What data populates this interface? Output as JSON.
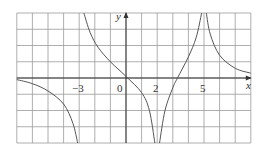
{
  "chart_data": {
    "type": "line",
    "title": "",
    "xlabel": "x",
    "ylabel": "y",
    "xlim": [
      -7,
      8
    ],
    "ylim": [
      -4,
      4
    ],
    "grid": true,
    "grid_step": 1,
    "x_tick_labels": [
      "-3",
      "0",
      "2",
      "5"
    ],
    "x_tick_values": [
      -3,
      0,
      2,
      5
    ],
    "vertical_asymptotes": [
      -3,
      2,
      5
    ],
    "horizontal_asymptote": 0,
    "series": [
      {
        "name": "branch-1",
        "domain": [
          -7,
          -3
        ],
        "behavior": "approaches 0 from below as x→-∞, → -∞ as x→-3⁻",
        "points": [
          [
            -7,
            -0.1
          ],
          [
            -6,
            -0.35
          ],
          [
            -5,
            -0.8
          ],
          [
            -4,
            -1.6
          ],
          [
            -3.4,
            -2.8
          ],
          [
            -3.1,
            -4
          ]
        ]
      },
      {
        "name": "branch-2",
        "domain": [
          -3,
          2
        ],
        "behavior": "+∞ as x→-3⁺, passes through origin, → -∞ as x→2⁻",
        "points": [
          [
            -2.7,
            4
          ],
          [
            -2.3,
            2.8
          ],
          [
            -1.8,
            1.9
          ],
          [
            -1,
            1.0
          ],
          [
            0,
            0.1
          ],
          [
            1,
            -0.9
          ],
          [
            1.5,
            -2
          ],
          [
            1.85,
            -4
          ]
        ]
      },
      {
        "name": "branch-3",
        "domain": [
          2,
          5
        ],
        "behavior": "-∞ as x→2⁺, crosses x-axis near x≈3.3, → +∞ as x→5⁻",
        "points": [
          [
            2.15,
            -4
          ],
          [
            2.5,
            -2
          ],
          [
            3,
            -0.6
          ],
          [
            3.3,
            0
          ],
          [
            4,
            1.3
          ],
          [
            4.5,
            2.5
          ],
          [
            4.85,
            4
          ]
        ]
      },
      {
        "name": "branch-4",
        "domain": [
          5,
          8
        ],
        "behavior": "+∞ as x→5⁺, decreases toward 0",
        "points": [
          [
            5.15,
            4
          ],
          [
            5.4,
            2.7
          ],
          [
            6,
            1.4
          ],
          [
            7,
            0.6
          ],
          [
            8,
            0.3
          ]
        ]
      }
    ]
  },
  "labels": {
    "x_axis": "x",
    "y_axis": "y",
    "tick_m3": "−3",
    "tick_0": "0",
    "tick_2": "2",
    "tick_5": "5"
  },
  "colors": {
    "grid": "#9a9a9a",
    "curve": "#555555",
    "axis": "#333333"
  }
}
